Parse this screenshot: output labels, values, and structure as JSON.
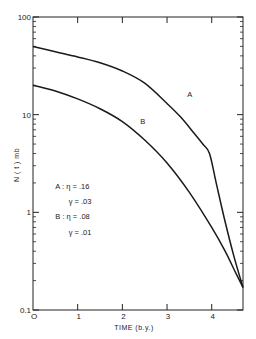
{
  "chart_data": {
    "type": "line",
    "title": "",
    "xlabel": "TIME  (b.y.)",
    "ylabel": "N ( t )  mb",
    "xscale": "linear",
    "yscale": "log",
    "xlim": [
      0,
      4.7
    ],
    "ylim": [
      0.1,
      100
    ],
    "grid": false,
    "x_ticks": [
      0,
      1,
      2,
      3,
      4
    ],
    "x_tick_labels": [
      "O",
      "1",
      "2",
      "3",
      "4"
    ],
    "y_ticks": [
      0.1,
      1,
      10,
      100
    ],
    "y_tick_labels": [
      "0.1",
      "1",
      "10",
      "100"
    ],
    "series": [
      {
        "name": "A",
        "x": [
          0,
          0.5,
          1.0,
          1.5,
          2.0,
          2.5,
          3.0,
          3.3,
          3.6,
          3.8,
          3.95,
          4.1,
          4.3,
          4.5,
          4.7
        ],
        "values": [
          50,
          44,
          39,
          34,
          28,
          21,
          13,
          9.5,
          6.5,
          5.0,
          4.0,
          2.0,
          0.8,
          0.35,
          0.17
        ]
      },
      {
        "name": "B",
        "x": [
          0,
          0.5,
          1.0,
          1.5,
          2.0,
          2.5,
          3.0,
          3.5,
          4.0,
          4.3,
          4.5,
          4.7
        ],
        "values": [
          20,
          17.5,
          14.5,
          11.5,
          8.5,
          5.5,
          3.2,
          1.6,
          0.7,
          0.4,
          0.26,
          0.17
        ]
      }
    ],
    "curve_labels": [
      {
        "series": "A",
        "text": "A",
        "x": 3.45,
        "y": 15
      },
      {
        "series": "B",
        "text": "B",
        "x": 2.4,
        "y": 8
      }
    ],
    "annotations": [
      {
        "text": "A :  η = .16",
        "x": 0.5,
        "y": 1.75
      },
      {
        "text": "γ = .03",
        "x": 0.8,
        "y": 1.22
      },
      {
        "text": "B :  η = .08",
        "x": 0.5,
        "y": 0.85
      },
      {
        "text": "γ = .01",
        "x": 0.8,
        "y": 0.59
      }
    ]
  },
  "caption": "Fig. — Number density of (a) N(t) in mb as a function of time"
}
